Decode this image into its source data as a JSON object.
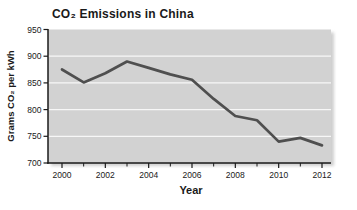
{
  "chart_data": {
    "type": "line",
    "title": "CO₂ Emissions in China",
    "xlabel": "Year",
    "ylabel": "Grams CO₂ per kWh",
    "x": [
      2000,
      2001,
      2002,
      2003,
      2004,
      2005,
      2006,
      2007,
      2008,
      2009,
      2010,
      2011,
      2012
    ],
    "values": [
      875,
      851,
      868,
      890,
      878,
      866,
      856,
      820,
      788,
      780,
      740,
      747,
      733
    ],
    "series_name": "Grams CO2 per kWh",
    "ylim": [
      700,
      950
    ],
    "yticks": [
      700,
      750,
      800,
      850,
      900,
      950
    ],
    "xticks": [
      2000,
      2002,
      2004,
      2006,
      2008,
      2010,
      2012
    ],
    "xminorticks": [
      2001,
      2003,
      2005,
      2007,
      2009,
      2011
    ],
    "grid": "horizontal",
    "legend": "none",
    "colors": {
      "line": "#4f4f4f",
      "plot_bg": "#d2d2d2",
      "gridline": "#f7f7f7",
      "axis": "#1a1a1a",
      "text": "#1a1a1a",
      "shadow": "#a8a8a8"
    }
  }
}
